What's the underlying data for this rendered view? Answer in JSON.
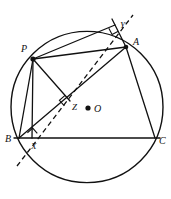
{
  "figure": {
    "type": "geometry-diagram",
    "width": 171,
    "height": 199,
    "background_color": "#ffffff",
    "stroke_color": "#111111"
  },
  "labels": {
    "point_p": "P",
    "point_a": "A",
    "point_b": "B",
    "point_c": "C",
    "point_o": "O",
    "point_x": "X",
    "point_y": "Y",
    "point_z": "Z"
  },
  "geometry": {
    "circle": {
      "cx": 87,
      "cy": 107,
      "r": 76,
      "stroke_width": 1.4
    },
    "points": {
      "P": {
        "x": 33,
        "y": 59,
        "label_x": 21,
        "label_y": 44,
        "dot": true,
        "dot_r": 2.6
      },
      "A": {
        "x": 126,
        "y": 47,
        "label_x": 133,
        "label_y": 37,
        "dot": true,
        "dot_r": 2.3
      },
      "B": {
        "x": 19,
        "y": 138,
        "label_x": 5,
        "label_y": 134,
        "dot": false,
        "dot_r": 0
      },
      "C": {
        "x": 155,
        "y": 138,
        "label_x": 159,
        "label_y": 136,
        "dot": false,
        "dot_r": 0
      },
      "O": {
        "x": 88,
        "y": 108,
        "label_x": 94,
        "label_y": 104,
        "dot": true,
        "dot_r": 2.6
      },
      "X": {
        "x": 32,
        "y": 138,
        "label_x": 31,
        "label_y": 142,
        "dot": false,
        "dot_r": 0
      },
      "Y": {
        "x": 115,
        "y": 25,
        "label_x": 120,
        "label_y": 21,
        "dot": false,
        "dot_r": 0
      },
      "Z": {
        "x": 70,
        "y": 101,
        "label_x": 72,
        "label_y": 103,
        "dot": false,
        "dot_r": 0
      }
    },
    "solid_segments": [
      {
        "name": "side-bc",
        "x1": 14,
        "y1": 138,
        "x2": 160,
        "y2": 138
      },
      {
        "name": "side-ab",
        "x1": 19,
        "y1": 138,
        "x2": 126,
        "y2": 47
      },
      {
        "name": "side-ac",
        "x1": 126,
        "y1": 47,
        "x2": 155,
        "y2": 138
      },
      {
        "name": "chord-pb",
        "x1": 33,
        "y1": 59,
        "x2": 19,
        "y2": 138
      },
      {
        "name": "chord-pa",
        "x1": 33,
        "y1": 59,
        "x2": 126,
        "y2": 47
      },
      {
        "name": "perp-px",
        "x1": 33,
        "y1": 59,
        "x2": 32,
        "y2": 138
      },
      {
        "name": "perp-pz",
        "x1": 33,
        "y1": 59,
        "x2": 70,
        "y2": 101
      },
      {
        "name": "perp-py",
        "x1": 33,
        "y1": 59,
        "x2": 115,
        "y2": 25
      },
      {
        "name": "ext-ay",
        "x1": 126,
        "y1": 47,
        "x2": 112,
        "y2": 19
      }
    ],
    "dashed_segments": [
      {
        "name": "simson-line",
        "x1": 17,
        "y1": 166,
        "x2": 133,
        "y2": 15
      }
    ],
    "right_angle_marks": [
      {
        "name": "right-angle-at-x",
        "x": 32,
        "y": 138,
        "size": 7,
        "rotation": -41
      },
      {
        "name": "right-angle-at-z",
        "x": 70,
        "y": 101,
        "size": 7.5,
        "rotation": -131
      },
      {
        "name": "right-angle-at-y",
        "x": 115,
        "y": 25,
        "size": 7,
        "rotation": 152
      }
    ]
  }
}
